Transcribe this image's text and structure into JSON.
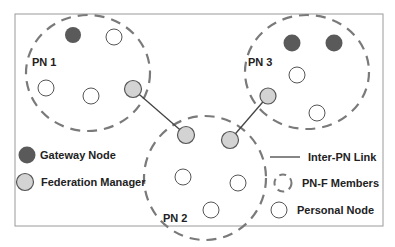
{
  "diagram": {
    "colors": {
      "gateway": "#5a5a5a",
      "federation_manager": "#d3d3d3",
      "personal_node": "#ffffff",
      "node_stroke": "#555555",
      "dashed": "#7a7a7a",
      "link": "#444444",
      "frame": "#999999"
    },
    "networks": [
      {
        "label": "PN 1"
      },
      {
        "label": "PN 2"
      },
      {
        "label": "PN 3"
      }
    ],
    "legend": {
      "gateway": "Gateway Node",
      "federation_manager": "Federation Manager",
      "inter_pn_link": "Inter-PN Link",
      "pnf_members": "PN-F Members",
      "personal_node": "Personal Node"
    }
  }
}
